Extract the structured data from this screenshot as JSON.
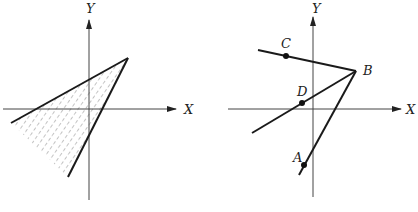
{
  "left_figure": {
    "axes": {
      "x_label": "X",
      "y_label": "Y"
    },
    "description": "Shaded (hatched) wedge region bounded by two lines meeting at upper right",
    "colors": {
      "line": "#1a1a1a",
      "hatch": "#555555",
      "axis": "#444444"
    }
  },
  "right_figure": {
    "axes": {
      "x_label": "X",
      "y_label": "Y"
    },
    "points": {
      "A": "A",
      "B": "B",
      "C": "C",
      "D": "D"
    },
    "colors": {
      "line": "#1a1a1a",
      "point": "#111111",
      "axis": "#444444"
    }
  }
}
